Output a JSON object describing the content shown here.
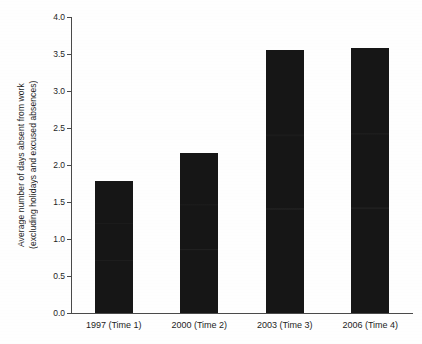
{
  "chart_data": {
    "type": "bar",
    "title": "",
    "xlabel": "",
    "ylabel_line1": "Average number of days absent from work",
    "ylabel_line2": "(excluding holidays and excused absences)",
    "categories": [
      "1997 (Time 1)",
      "2000 (Time 2)",
      "2003 (Time 3)",
      "2006 (Time 4)"
    ],
    "values": [
      1.78,
      2.16,
      3.55,
      3.58
    ],
    "ylim": [
      0.0,
      4.0
    ],
    "ytick_labels": [
      "0.0",
      "0.5",
      "1.0",
      "1.5",
      "2.0",
      "2.5",
      "3.0",
      "3.5",
      "4.0"
    ],
    "ytick_values": [
      0.0,
      0.5,
      1.0,
      1.5,
      2.0,
      2.5,
      3.0,
      3.5,
      4.0
    ],
    "grid": false,
    "legend": "none",
    "bar_color": "#161616",
    "axis_color": "#4a4a4a",
    "background_color": "#ffffff"
  }
}
